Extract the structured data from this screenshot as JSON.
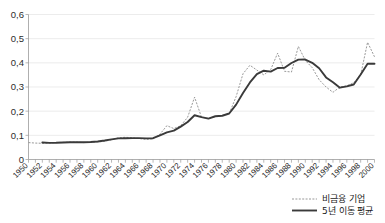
{
  "chart_data": {
    "type": "line",
    "title": "",
    "subtitle": "",
    "xlabel": "",
    "ylabel": "",
    "xlim": [
      1950,
      2000
    ],
    "ylim": [
      0,
      0.6
    ],
    "grid": "horizontal",
    "legend_position": "bottom-right",
    "decimal_separator": ",",
    "y_ticks": [
      0,
      0.1,
      0.2,
      0.3,
      0.4,
      0.5,
      0.6
    ],
    "y_tick_labels": [
      "0",
      "0,1",
      "0,2",
      "0,3",
      "0,4",
      "0,5",
      "0,6"
    ],
    "x_ticks": [
      1950,
      1952,
      1954,
      1956,
      1958,
      1960,
      1962,
      1964,
      1966,
      1968,
      1970,
      1972,
      1974,
      1976,
      1978,
      1980,
      1982,
      1984,
      1986,
      1988,
      1990,
      1992,
      1994,
      1996,
      1998,
      2000
    ],
    "x_tick_labels": [
      "1950",
      "1952",
      "1954",
      "1956",
      "1958",
      "1960",
      "1962",
      "1964",
      "1966",
      "1968",
      "1970",
      "1972",
      "1974",
      "1976",
      "1978",
      "1980",
      "1982",
      "1984",
      "1986",
      "1988",
      "1990",
      "1992",
      "1994",
      "1996",
      "1998",
      "2000"
    ],
    "x_tick_rotation": -45,
    "x": [
      1950,
      1951,
      1952,
      1953,
      1954,
      1955,
      1956,
      1957,
      1958,
      1959,
      1960,
      1961,
      1962,
      1963,
      1964,
      1965,
      1966,
      1967,
      1968,
      1969,
      1970,
      1971,
      1972,
      1973,
      1974,
      1975,
      1976,
      1977,
      1978,
      1979,
      1980,
      1981,
      1982,
      1983,
      1984,
      1985,
      1986,
      1987,
      1988,
      1989,
      1990,
      1991,
      1992,
      1993,
      1994,
      1995,
      1996,
      1997,
      1998,
      1999,
      2000
    ],
    "series": [
      {
        "name": "비금융 기업",
        "style": "dotted",
        "color": "#8d8d8d",
        "values": [
          0.07,
          0.068,
          0.067,
          0.068,
          0.07,
          0.071,
          0.072,
          0.072,
          0.07,
          0.072,
          0.073,
          0.075,
          0.082,
          0.09,
          0.092,
          0.09,
          0.087,
          0.083,
          0.086,
          0.105,
          0.14,
          0.128,
          0.14,
          0.175,
          0.258,
          0.175,
          0.17,
          0.178,
          0.182,
          0.19,
          0.26,
          0.355,
          0.39,
          0.37,
          0.35,
          0.372,
          0.44,
          0.365,
          0.362,
          0.468,
          0.41,
          0.38,
          0.33,
          0.3,
          0.278,
          0.3,
          0.305,
          0.318,
          0.35,
          0.485,
          0.425
        ]
      },
      {
        "name": "5년 이동 평균",
        "style": "solid",
        "color": "#3a3a3a",
        "values": [
          null,
          null,
          0.0706,
          0.0688,
          0.069,
          0.0706,
          0.0714,
          0.0714,
          0.0714,
          0.0722,
          0.0744,
          0.0784,
          0.0834,
          0.0876,
          0.0882,
          0.0884,
          0.0884,
          0.0876,
          0.0882,
          0.1,
          0.1124,
          0.1192,
          0.1362,
          0.1552,
          0.1832,
          0.1752,
          0.1692,
          0.179,
          0.181,
          0.1904,
          0.227,
          0.2754,
          0.319,
          0.353,
          0.3674,
          0.3638,
          0.3786,
          0.3798,
          0.3994,
          0.4134,
          0.4136,
          0.4,
          0.3776,
          0.3396,
          0.3196,
          0.2972,
          0.3026,
          0.3102,
          0.3516,
          0.396,
          0.396
        ]
      }
    ],
    "legend": [
      {
        "label": "비금융 기업",
        "style": "dotted",
        "color": "#8d8d8d"
      },
      {
        "label": "5년 이동 평균",
        "style": "solid",
        "color": "#3a3a3a"
      }
    ]
  }
}
